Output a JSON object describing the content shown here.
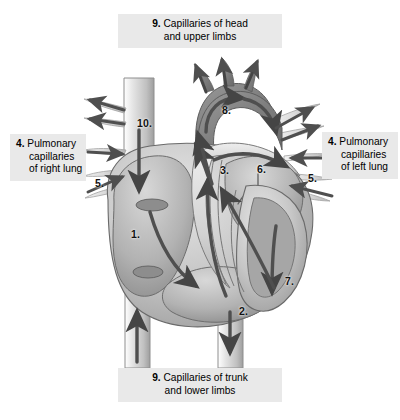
{
  "figure": {
    "style": "grayscale anatomical cross-section with blood-flow arrows"
  },
  "captions": {
    "top": {
      "number": "9.",
      "line1": "Capillaries of head",
      "line2": "and upper limbs"
    },
    "bottom": {
      "number": "9.",
      "line1": "Capillaries of trunk",
      "line2": "and lower limbs"
    },
    "left": {
      "number": "4.",
      "line1": "Pulmonary",
      "line2": "capillaries",
      "line3": "of right lung"
    },
    "right": {
      "number": "4.",
      "line1": "Pulmonary",
      "line2": "capillaries",
      "line3": "of left lung"
    }
  },
  "callouts": [
    {
      "id": "right-atrium",
      "label": "1.",
      "x": 131,
      "y": 228
    },
    {
      "id": "right-ventricle",
      "label": "2.",
      "x": 239,
      "y": 305
    },
    {
      "id": "pulmonary-trunk",
      "label": "3.",
      "x": 220,
      "y": 164
    },
    {
      "id": "pulmonary-vein-left",
      "label": "5.",
      "x": 308,
      "y": 172
    },
    {
      "id": "pulmonary-vein-right",
      "label": "5.",
      "x": 95,
      "y": 177
    },
    {
      "id": "left-atrium",
      "label": "6.",
      "x": 257,
      "y": 163
    },
    {
      "id": "left-ventricle",
      "label": "7.",
      "x": 285,
      "y": 275
    },
    {
      "id": "aortic-arch",
      "label": "8.",
      "x": 222,
      "y": 104
    },
    {
      "id": "superior-vena-cava",
      "label": "10.",
      "x": 137,
      "y": 117
    }
  ],
  "palette": {
    "caption_bg": "#e9e9e9",
    "text": "#000000",
    "vessel_light": "#d9d9d9",
    "vessel_mid": "#b9b9b9",
    "vessel_dark": "#8f8f8f",
    "chamber_dark": "#7e7e7e",
    "outline": "#4a4a4a",
    "arrow_dark": "#4f4f4f",
    "arrow_mid": "#6b6b6b",
    "background": "#ffffff"
  }
}
